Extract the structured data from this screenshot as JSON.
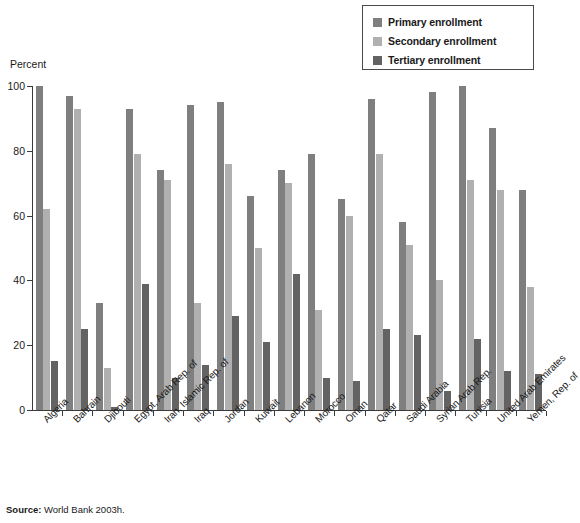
{
  "ylabel": "Percent",
  "source_prefix": "Source:",
  "source_text": " World Bank 2003h.",
  "legend": {
    "items": [
      {
        "label": "Primary enrollment",
        "color": "#7f7f7f",
        "icon": "square-swatch-icon"
      },
      {
        "label": "Secondary enrollment",
        "color": "#b0b0b0",
        "icon": "square-swatch-icon"
      },
      {
        "label": "Tertiary enrollment",
        "color": "#636363",
        "icon": "square-swatch-icon"
      }
    ]
  },
  "chart_data": {
    "type": "bar",
    "title": "",
    "xlabel": "",
    "ylabel": "Percent",
    "ylim": [
      0,
      100
    ],
    "yticks": [
      0,
      20,
      40,
      60,
      80,
      100
    ],
    "grid": false,
    "legend_position": "top-right",
    "source": "Source: World Bank 2003h.",
    "categories": [
      "Algeria",
      "Bahrain",
      "Djibouti",
      "Egypt, Arab Rep. of",
      "Iran, Islamic Rep. of",
      "Iraq",
      "Jordan",
      "Kuwait",
      "Lebanon",
      "Morocco",
      "Oman",
      "Qatar",
      "Saudi Arabia",
      "Syrian Arab Rep.",
      "Tunisia",
      "United Arab Emirates",
      "Yemen, Rep. of"
    ],
    "series": [
      {
        "name": "Primary enrollment",
        "color": "#7f7f7f",
        "values": [
          100,
          97,
          33,
          93,
          74,
          94,
          95,
          66,
          74,
          79,
          65,
          96,
          58,
          98,
          100,
          87,
          68
        ]
      },
      {
        "name": "Secondary enrollment",
        "color": "#b0b0b0",
        "values": [
          62,
          93,
          13,
          79,
          71,
          33,
          76,
          50,
          70,
          31,
          60,
          79,
          51,
          40,
          71,
          68,
          38
        ]
      },
      {
        "name": "Tertiary enrollment",
        "color": "#636363",
        "values": [
          15,
          25,
          1,
          39,
          10,
          14,
          29,
          21,
          42,
          10,
          9,
          25,
          23,
          6,
          22,
          12,
          11
        ]
      }
    ]
  }
}
